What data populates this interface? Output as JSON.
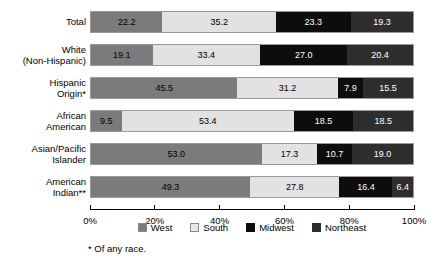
{
  "chart_data": {
    "type": "bar",
    "variant": "stacked-horizontal-100pct",
    "title": "",
    "xlabel": "",
    "ylabel": "",
    "xlim": [
      0,
      100
    ],
    "grid": false,
    "legend_position": "bottom-center",
    "categories": [
      "Total",
      "White\n(Non-Hispanic)",
      "Hispanic\nOrigin*",
      "African\nAmerican",
      "Asian/Pacific\nIslander",
      "American\nIndian**"
    ],
    "series": [
      {
        "name": "West",
        "color": "#7b7b7b",
        "values": [
          22.2,
          19.1,
          45.5,
          9.5,
          53.0,
          49.3
        ]
      },
      {
        "name": "South",
        "color": "#e2e2e2",
        "values": [
          35.2,
          33.4,
          31.2,
          53.4,
          17.3,
          27.8
        ]
      },
      {
        "name": "Midwest",
        "color": "#0d0d0d",
        "values": [
          23.3,
          27.0,
          7.9,
          18.5,
          10.7,
          16.4
        ]
      },
      {
        "name": "Northeast",
        "color": "#2e2e2e",
        "values": [
          19.3,
          20.4,
          15.5,
          18.5,
          19.0,
          6.4
        ]
      }
    ],
    "tick_labels": [
      "0%",
      "20%",
      "40%",
      "60%",
      "80%",
      "100%"
    ],
    "tick_values": [
      0,
      20,
      40,
      60,
      80,
      100
    ],
    "annotations": [
      "* Of any race."
    ]
  },
  "legend": {
    "items": [
      {
        "label": "West"
      },
      {
        "label": "South"
      },
      {
        "label": "Midwest"
      },
      {
        "label": "Northeast"
      }
    ]
  },
  "footnote": {
    "text": "* Of any race."
  }
}
